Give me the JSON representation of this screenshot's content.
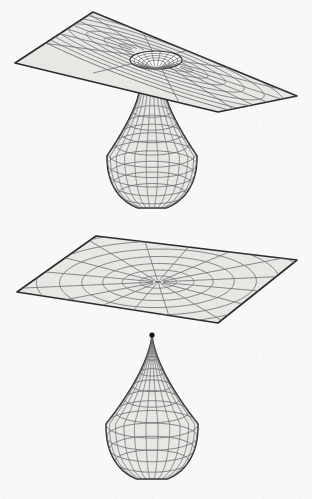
{
  "figure": {
    "background_color": "#f8f8f7",
    "surface_fill": "#e7e7e4",
    "grid_line_color": "#6e6e72",
    "outline_color": "#2b2b2f",
    "cusp_marker_color": "#151518"
  },
  "panels": [
    {
      "id": "upper",
      "name": "wormhole-throat-attached",
      "description": "Flat sheet with a funnel throat opening at the centre, joined to a pear-shaped bulb hanging below",
      "plane": {
        "name": "upper-plane",
        "corners": [
          [
            93,
            12
          ],
          [
            297,
            96
          ],
          [
            218,
            112
          ],
          [
            15,
            63
          ]
        ],
        "center": [
          156,
          58
        ],
        "rings": 8,
        "spokes": 16,
        "throat_open": true,
        "throat_radius_x": 26,
        "throat_radius_y": 9
      },
      "bulb": {
        "name": "upper-bulb",
        "center_x": 152,
        "neck_top_y": 92,
        "bottom_y": 208,
        "max_radius": 45,
        "neck_radius": 13,
        "meridians": 12,
        "latitudes": 9,
        "has_cusp": false
      }
    },
    {
      "id": "lower",
      "name": "pinched-sheet-and-detached-teardrop",
      "description": "Flat sheet pinched to a point at the centre, with a detached teardrop surface below terminating in a conical cusp",
      "plane": {
        "name": "lower-plane",
        "corners": [
          [
            96,
            236
          ],
          [
            297,
            260
          ],
          [
            218,
            323
          ],
          [
            17,
            292
          ]
        ],
        "center": [
          158,
          282
        ],
        "rings": 8,
        "spokes": 16,
        "throat_open": false,
        "throat_radius_x": 0,
        "throat_radius_y": 0
      },
      "bulb": {
        "name": "lower-bulb",
        "center_x": 152,
        "neck_top_y": 334,
        "bottom_y": 479,
        "max_radius": 46,
        "neck_radius": 0.5,
        "meridians": 12,
        "latitudes": 9,
        "has_cusp": true,
        "cusp_point": [
          152,
          334
        ]
      }
    }
  ]
}
